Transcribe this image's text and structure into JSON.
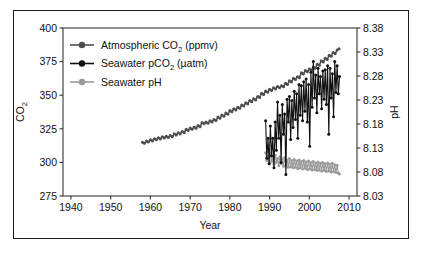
{
  "figure": {
    "background_color": "#ffffff",
    "frame_color": "#1a1a1a"
  },
  "chart_data": {
    "type": "line",
    "title": "",
    "subtitle": "",
    "xlabel": "Year",
    "ylabel": "CO2",
    "ylabel_display": "CO",
    "ylabel_sub": "2",
    "y2label": "pH",
    "grid": false,
    "legend_position": "upper-left-inside",
    "xlim": [
      1938,
      2012
    ],
    "xticks": [
      1940,
      1950,
      1960,
      1970,
      1980,
      1990,
      2000,
      2010
    ],
    "xtick_labels": [
      "1940",
      "1950",
      "1960",
      "1970",
      "1980",
      "1990",
      "2000",
      "2010"
    ],
    "ylim": [
      275,
      400
    ],
    "yticks": [
      275,
      300,
      325,
      350,
      375,
      400
    ],
    "ytick_labels": [
      "275",
      "300",
      "325",
      "350",
      "375",
      "400"
    ],
    "y2lim": [
      8.03,
      8.38
    ],
    "y2ticks": [
      8.03,
      8.08,
      8.13,
      8.18,
      8.23,
      8.28,
      8.33,
      8.38
    ],
    "y2tick_labels": [
      "8.03",
      "8.08",
      "8.13",
      "8.18",
      "8.23",
      "8.28",
      "8.33",
      "8.38"
    ],
    "series": [
      {
        "name": "Atmospheric CO2 (ppmv)",
        "legend_display": "Atmospheric CO",
        "legend_sub": "2",
        "legend_tail": " (ppmv)",
        "color": "#4d4d4d",
        "axis": "left",
        "marker": "circle",
        "x": [
          1958.0,
          1958.5,
          1959.0,
          1959.5,
          1960.0,
          1960.5,
          1961.0,
          1961.5,
          1962.0,
          1962.5,
          1963.0,
          1963.5,
          1964.0,
          1964.5,
          1965.0,
          1965.5,
          1966.0,
          1966.5,
          1967.0,
          1967.5,
          1968.0,
          1968.5,
          1969.0,
          1969.5,
          1970.0,
          1970.5,
          1971.0,
          1971.5,
          1972.0,
          1972.5,
          1973.0,
          1973.5,
          1974.0,
          1974.5,
          1975.0,
          1975.5,
          1976.0,
          1976.5,
          1977.0,
          1977.5,
          1978.0,
          1978.5,
          1979.0,
          1979.5,
          1980.0,
          1980.5,
          1981.0,
          1981.5,
          1982.0,
          1982.5,
          1983.0,
          1983.5,
          1984.0,
          1984.5,
          1985.0,
          1985.5,
          1986.0,
          1986.5,
          1987.0,
          1987.5,
          1988.0,
          1988.5,
          1989.0,
          1989.5,
          1990.0,
          1990.5,
          1991.0,
          1991.5,
          1992.0,
          1992.5,
          1993.0,
          1993.5,
          1994.0,
          1994.5,
          1995.0,
          1995.5,
          1996.0,
          1996.5,
          1997.0,
          1997.5,
          1998.0,
          1998.5,
          1999.0,
          1999.5,
          2000.0,
          2000.5,
          2001.0,
          2001.5,
          2002.0,
          2002.5,
          2003.0,
          2003.5,
          2004.0,
          2004.5,
          2005.0,
          2005.5,
          2006.0,
          2006.5,
          2007.0,
          2007.5
        ],
        "y": [
          315.0,
          314.2,
          315.9,
          315.1,
          316.9,
          316.0,
          317.6,
          316.8,
          318.4,
          317.5,
          319.0,
          318.2,
          319.5,
          318.6,
          320.0,
          319.1,
          321.3,
          320.4,
          322.1,
          321.2,
          323.0,
          322.1,
          324.6,
          323.7,
          325.6,
          324.7,
          326.3,
          325.4,
          327.4,
          326.5,
          329.6,
          328.7,
          330.1,
          329.2,
          331.0,
          330.1,
          332.0,
          331.1,
          333.7,
          332.8,
          335.3,
          334.4,
          336.7,
          335.8,
          338.6,
          337.7,
          339.9,
          339.0,
          341.1,
          340.2,
          342.8,
          341.9,
          344.4,
          343.5,
          346.0,
          345.1,
          347.4,
          346.5,
          349.1,
          348.2,
          351.5,
          350.6,
          353.1,
          352.2,
          354.4,
          353.5,
          355.6,
          354.7,
          356.4,
          355.5,
          357.1,
          356.2,
          358.8,
          357.9,
          360.8,
          359.9,
          362.6,
          361.7,
          363.8,
          362.9,
          366.7,
          365.8,
          368.3,
          367.4,
          369.5,
          368.6,
          371.0,
          370.1,
          373.1,
          372.2,
          375.6,
          374.7,
          377.4,
          376.5,
          379.8,
          378.9,
          381.8,
          380.9,
          383.7,
          384.5
        ],
        "note": "smooth monotonic rise with seasonal wiggle, Mauna Loa record 1958-2008"
      },
      {
        "name": "Seawater pCO2 (uatm)",
        "legend_display": "Seawater pCO",
        "legend_sub": "2",
        "legend_tail": " (µatm)",
        "color": "#111111",
        "axis": "left",
        "marker": "circle",
        "x": [
          1989.0,
          1989.3,
          1989.6,
          1989.9,
          1990.2,
          1990.5,
          1990.8,
          1991.1,
          1991.4,
          1991.7,
          1992.0,
          1992.3,
          1992.6,
          1992.9,
          1993.2,
          1993.5,
          1993.8,
          1994.1,
          1994.4,
          1994.7,
          1995.0,
          1995.3,
          1995.6,
          1995.9,
          1996.2,
          1996.5,
          1996.8,
          1997.1,
          1997.4,
          1997.7,
          1998.0,
          1998.3,
          1998.6,
          1998.9,
          1999.2,
          1999.5,
          1999.8,
          2000.1,
          2000.4,
          2000.7,
          2001.0,
          2001.3,
          2001.6,
          2001.9,
          2002.2,
          2002.5,
          2002.8,
          2003.1,
          2003.4,
          2003.7,
          2004.0,
          2004.3,
          2004.6,
          2004.9,
          2005.2,
          2005.5,
          2005.8,
          2006.1,
          2006.4,
          2006.7,
          2007.0,
          2007.3,
          2007.6
        ],
        "y": [
          331.0,
          303.0,
          318.0,
          299.0,
          327.0,
          305.0,
          318.0,
          296.0,
          330.0,
          309.0,
          345.0,
          318.0,
          335.0,
          300.0,
          343.0,
          321.0,
          336.0,
          291.0,
          347.0,
          330.0,
          349.0,
          317.0,
          346.0,
          326.0,
          353.0,
          332.0,
          351.0,
          318.0,
          358.0,
          335.0,
          357.0,
          331.0,
          360.0,
          338.0,
          362.0,
          330.0,
          358.0,
          312.0,
          367.0,
          341.0,
          375.0,
          348.0,
          365.0,
          337.0,
          370.0,
          351.0,
          364.0,
          340.0,
          368.0,
          347.0,
          369.0,
          343.0,
          372.0,
          321.0,
          370.0,
          348.0,
          366.0,
          334.0,
          375.0,
          352.0,
          372.0,
          351.0,
          364.0
        ],
        "note": "Station ALOHA seawater pCO2, strong seasonal oscillation, rising trend"
      },
      {
        "name": "Seawater pH",
        "legend_display": "Seawater pH",
        "legend_sub": "",
        "legend_tail": "",
        "color": "#9a9a9a",
        "axis": "right",
        "marker": "circle",
        "x": [
          1989.0,
          1989.3,
          1989.6,
          1989.9,
          1990.2,
          1990.5,
          1990.8,
          1991.1,
          1991.4,
          1991.7,
          1992.0,
          1992.3,
          1992.6,
          1992.9,
          1993.2,
          1993.5,
          1993.8,
          1994.1,
          1994.4,
          1994.7,
          1995.0,
          1995.3,
          1995.6,
          1995.9,
          1996.2,
          1996.5,
          1996.8,
          1997.1,
          1997.4,
          1997.7,
          1998.0,
          1998.3,
          1998.6,
          1998.9,
          1999.2,
          1999.5,
          1999.8,
          2000.1,
          2000.4,
          2000.7,
          2001.0,
          2001.3,
          2001.6,
          2001.9,
          2002.2,
          2002.5,
          2002.8,
          2003.1,
          2003.4,
          2003.7,
          2004.0,
          2004.3,
          2004.6,
          2004.9,
          2005.2,
          2005.5,
          2005.8,
          2006.1,
          2006.4,
          2006.7,
          2007.0,
          2007.3,
          2007.6
        ],
        "y": [
          8.12,
          8.104,
          8.113,
          8.098,
          8.119,
          8.102,
          8.111,
          8.096,
          8.115,
          8.1,
          8.108,
          8.093,
          8.112,
          8.097,
          8.107,
          8.092,
          8.11,
          8.094,
          8.105,
          8.09,
          8.108,
          8.091,
          8.104,
          8.089,
          8.106,
          8.09,
          8.103,
          8.087,
          8.105,
          8.089,
          8.102,
          8.086,
          8.104,
          8.088,
          8.101,
          8.085,
          8.103,
          8.086,
          8.1,
          8.084,
          8.102,
          8.085,
          8.099,
          8.083,
          8.101,
          8.084,
          8.098,
          8.082,
          8.1,
          8.083,
          8.097,
          8.081,
          8.099,
          8.082,
          8.096,
          8.08,
          8.098,
          8.081,
          8.095,
          8.079,
          8.094,
          8.078,
          8.076
        ],
        "note": "Station ALOHA seawater pH, seasonal oscillation, declining trend"
      }
    ]
  }
}
